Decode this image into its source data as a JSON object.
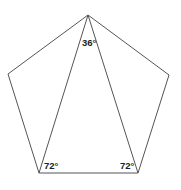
{
  "diagram": {
    "type": "geometry",
    "pentagon": {
      "vertices": [
        {
          "name": "top",
          "x": 88,
          "y": 15
        },
        {
          "name": "right",
          "x": 169,
          "y": 75
        },
        {
          "name": "bottom-right",
          "x": 138,
          "y": 173
        },
        {
          "name": "bottom-left",
          "x": 39,
          "y": 173
        },
        {
          "name": "left",
          "x": 8,
          "y": 74
        }
      ]
    },
    "triangle": {
      "vertices": [
        "top",
        "bottom-left",
        "bottom-right"
      ]
    },
    "labels": {
      "apex_angle": "36°",
      "bottom_left_angle": "72°",
      "bottom_right_angle": "72°"
    },
    "colors": {
      "stroke": "#555555",
      "text": "#222222",
      "background": "#ffffff"
    }
  }
}
